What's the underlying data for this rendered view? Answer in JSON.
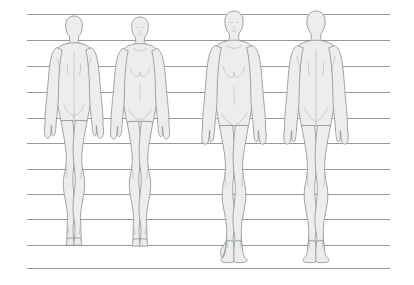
{
  "sheet": {
    "title": "Figure Proportion Reference Sheet",
    "background_color": "#ffffff",
    "width": 414,
    "height": 285
  },
  "grid": {
    "name": "horizontal-proportion-guides",
    "line_color": "#8e8e8e",
    "line_width": 0.9,
    "x_start": 27,
    "x_end": 390,
    "count": 11,
    "y_positions": [
      14,
      40,
      66,
      92,
      118,
      143,
      169,
      194,
      219,
      245,
      268
    ],
    "ground_line_index": 9,
    "notes": "evenly spaced horizontal proportion guide lines spanning the sheet"
  },
  "figures": [
    {
      "id": "figure-1",
      "label": "Figure 1",
      "view": "back",
      "head_top_y": 16,
      "feet_y": 245,
      "center_x": 74,
      "height_px": 229,
      "fill_color": "#eceded",
      "stroke_color": "#8a8f92",
      "stroke_width": 0.8
    },
    {
      "id": "figure-2",
      "label": "Figure 2",
      "view": "front",
      "head_top_y": 17,
      "feet_y": 245,
      "center_x": 140,
      "height_px": 228,
      "fill_color": "#eceded",
      "stroke_color": "#8a8f92",
      "stroke_width": 0.8
    },
    {
      "id": "figure-3",
      "label": "Figure 3",
      "view": "front",
      "head_top_y": 11,
      "feet_y": 249,
      "center_x": 234,
      "height_px": 238,
      "fill_color": "#eceded",
      "stroke_color": "#8a8f92",
      "stroke_width": 0.8
    },
    {
      "id": "figure-4",
      "label": "Figure 4",
      "view": "back",
      "head_top_y": 11,
      "feet_y": 249,
      "center_x": 316,
      "height_px": 238,
      "fill_color": "#eceded",
      "stroke_color": "#8a8f92",
      "stroke_width": 0.8
    }
  ],
  "colors": {
    "page_background": "#ffffff",
    "guide_line": "#8e8e8e",
    "figure_fill": "#eceded",
    "figure_outline": "#8a8f92",
    "detail_line": "#a9adb0"
  }
}
